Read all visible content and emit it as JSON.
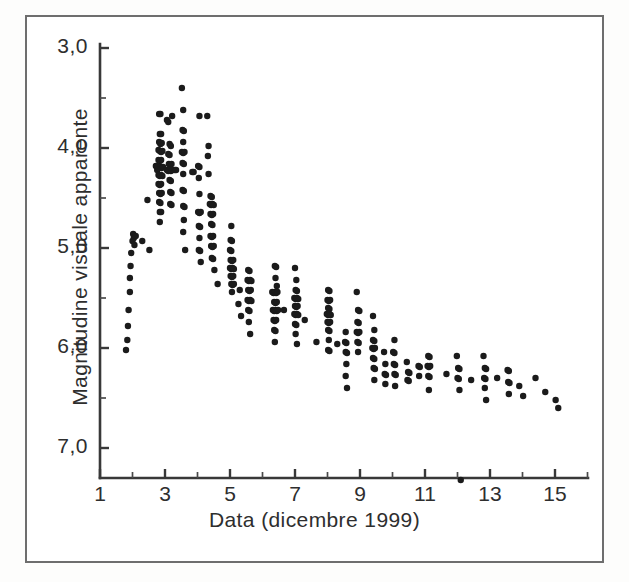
{
  "figure": {
    "background_color": "#ffffff",
    "frame_color": "#6e6e6e",
    "marker_color": "#1b1b1b"
  },
  "chart_data": {
    "type": "scatter",
    "title": "",
    "xlabel": "Data (dicembre 1999)",
    "ylabel": "Magnitudine visuale apparente",
    "xlim": [
      1,
      16
    ],
    "ylim": [
      7.6,
      3.0
    ],
    "y_inverted": true,
    "grid": false,
    "legend": null,
    "xticks_major": [
      1,
      3,
      5,
      7,
      9,
      11,
      13,
      15
    ],
    "xticks_major_labels": [
      "1",
      "3",
      "5",
      "7",
      "9",
      "11",
      "13",
      "15"
    ],
    "xticks_minor": [
      2,
      4,
      6,
      8,
      10,
      12,
      14,
      16
    ],
    "yticks_major": [
      3.0,
      4.0,
      5.0,
      6.0,
      7.0
    ],
    "yticks_major_labels": [
      "3,0",
      "4,0",
      "5,0",
      "6,0",
      "7,0"
    ],
    "yticks_minor": [
      3.5,
      4.5,
      5.5,
      6.5
    ],
    "marker": "filled-circle",
    "marker_size_px": 6.4,
    "points": [
      [
        1.8,
        6.02
      ],
      [
        1.84,
        5.92
      ],
      [
        1.86,
        5.78
      ],
      [
        1.88,
        5.62
      ],
      [
        1.92,
        5.44
      ],
      [
        1.92,
        5.3
      ],
      [
        1.94,
        5.18
      ],
      [
        1.96,
        5.05
      ],
      [
        2.0,
        4.93
      ],
      [
        2.02,
        4.86
      ],
      [
        2.04,
        4.9
      ],
      [
        2.06,
        4.97
      ],
      [
        2.1,
        4.88
      ],
      [
        2.3,
        4.93
      ],
      [
        2.46,
        4.52
      ],
      [
        2.52,
        5.02
      ],
      [
        2.72,
        4.18
      ],
      [
        2.76,
        4.22
      ],
      [
        2.82,
        3.66
      ],
      [
        2.86,
        3.66
      ],
      [
        2.84,
        3.86
      ],
      [
        2.88,
        3.86
      ],
      [
        2.82,
        3.94
      ],
      [
        2.86,
        3.96
      ],
      [
        2.9,
        3.95
      ],
      [
        2.8,
        4.02
      ],
      [
        2.84,
        4.03
      ],
      [
        2.88,
        4.04
      ],
      [
        2.92,
        4.03
      ],
      [
        2.8,
        4.12
      ],
      [
        2.84,
        4.13
      ],
      [
        2.88,
        4.12
      ],
      [
        2.74,
        4.18
      ],
      [
        2.78,
        4.19
      ],
      [
        2.82,
        4.2
      ],
      [
        2.86,
        4.19
      ],
      [
        2.9,
        4.2
      ],
      [
        2.94,
        4.19
      ],
      [
        2.8,
        4.27
      ],
      [
        2.84,
        4.28
      ],
      [
        2.88,
        4.27
      ],
      [
        2.92,
        4.28
      ],
      [
        2.8,
        4.36
      ],
      [
        2.84,
        4.37
      ],
      [
        2.88,
        4.36
      ],
      [
        2.82,
        4.45
      ],
      [
        2.86,
        4.46
      ],
      [
        2.9,
        4.45
      ],
      [
        2.82,
        4.54
      ],
      [
        2.86,
        4.55
      ],
      [
        2.84,
        4.64
      ],
      [
        2.88,
        4.64
      ],
      [
        2.84,
        4.74
      ],
      [
        3.06,
        3.72
      ],
      [
        3.1,
        3.74
      ],
      [
        3.22,
        3.68
      ],
      [
        3.14,
        3.96
      ],
      [
        3.18,
        3.98
      ],
      [
        3.1,
        4.06
      ],
      [
        3.14,
        4.07
      ],
      [
        3.12,
        4.16
      ],
      [
        3.16,
        4.17
      ],
      [
        3.2,
        4.16
      ],
      [
        3.06,
        4.22
      ],
      [
        3.1,
        4.23
      ],
      [
        3.14,
        4.22
      ],
      [
        3.18,
        4.23
      ],
      [
        3.22,
        4.22
      ],
      [
        3.14,
        4.32
      ],
      [
        3.18,
        4.33
      ],
      [
        3.16,
        4.44
      ],
      [
        3.2,
        4.45
      ],
      [
        3.16,
        4.56
      ],
      [
        3.2,
        4.57
      ],
      [
        3.3,
        4.22
      ],
      [
        3.34,
        4.22
      ],
      [
        3.52,
        3.4
      ],
      [
        3.56,
        3.62
      ],
      [
        3.54,
        3.82
      ],
      [
        3.58,
        3.83
      ],
      [
        3.56,
        3.94
      ],
      [
        3.52,
        4.04
      ],
      [
        3.56,
        4.05
      ],
      [
        3.6,
        4.04
      ],
      [
        3.54,
        4.15
      ],
      [
        3.58,
        4.16
      ],
      [
        3.56,
        4.26
      ],
      [
        3.54,
        4.42
      ],
      [
        3.58,
        4.43
      ],
      [
        3.56,
        4.58
      ],
      [
        3.6,
        4.59
      ],
      [
        3.58,
        4.72
      ],
      [
        3.56,
        4.84
      ],
      [
        3.62,
        5.02
      ],
      [
        3.84,
        4.24
      ],
      [
        3.88,
        4.24
      ],
      [
        4.06,
        3.68
      ],
      [
        4.02,
        4.18
      ],
      [
        4.06,
        4.19
      ],
      [
        4.04,
        4.3
      ],
      [
        4.06,
        4.46
      ],
      [
        4.02,
        4.64
      ],
      [
        4.06,
        4.65
      ],
      [
        4.1,
        4.64
      ],
      [
        4.04,
        4.78
      ],
      [
        4.08,
        4.79
      ],
      [
        4.06,
        4.9
      ],
      [
        4.04,
        5.02
      ],
      [
        4.08,
        5.03
      ],
      [
        4.1,
        5.14
      ],
      [
        4.3,
        3.68
      ],
      [
        4.34,
        3.98
      ],
      [
        4.32,
        4.08
      ],
      [
        4.34,
        4.26
      ],
      [
        4.4,
        4.48
      ],
      [
        4.44,
        4.49
      ],
      [
        4.38,
        4.56
      ],
      [
        4.42,
        4.57
      ],
      [
        4.46,
        4.56
      ],
      [
        4.5,
        4.57
      ],
      [
        4.4,
        4.66
      ],
      [
        4.44,
        4.67
      ],
      [
        4.48,
        4.66
      ],
      [
        4.42,
        4.76
      ],
      [
        4.46,
        4.77
      ],
      [
        4.4,
        4.88
      ],
      [
        4.44,
        4.89
      ],
      [
        4.48,
        4.88
      ],
      [
        4.42,
        4.98
      ],
      [
        4.46,
        4.99
      ],
      [
        4.5,
        4.98
      ],
      [
        4.44,
        5.1
      ],
      [
        4.48,
        5.11
      ],
      [
        4.52,
        5.22
      ],
      [
        4.62,
        5.36
      ],
      [
        5.04,
        4.78
      ],
      [
        5.02,
        4.92
      ],
      [
        5.06,
        4.93
      ],
      [
        5.0,
        5.02
      ],
      [
        5.04,
        5.03
      ],
      [
        5.02,
        5.12
      ],
      [
        5.06,
        5.13
      ],
      [
        5.1,
        5.12
      ],
      [
        5.0,
        5.2
      ],
      [
        5.04,
        5.21
      ],
      [
        5.08,
        5.2
      ],
      [
        5.12,
        5.21
      ],
      [
        5.02,
        5.28
      ],
      [
        5.06,
        5.29
      ],
      [
        5.1,
        5.28
      ],
      [
        5.04,
        5.36
      ],
      [
        5.08,
        5.37
      ],
      [
        5.12,
        5.36
      ],
      [
        5.06,
        5.44
      ],
      [
        5.3,
        5.42
      ],
      [
        5.26,
        5.56
      ],
      [
        5.34,
        5.68
      ],
      [
        5.56,
        5.22
      ],
      [
        5.6,
        5.23
      ],
      [
        5.54,
        5.32
      ],
      [
        5.58,
        5.33
      ],
      [
        5.62,
        5.32
      ],
      [
        5.66,
        5.33
      ],
      [
        5.56,
        5.42
      ],
      [
        5.6,
        5.43
      ],
      [
        5.64,
        5.42
      ],
      [
        5.54,
        5.52
      ],
      [
        5.58,
        5.53
      ],
      [
        5.62,
        5.52
      ],
      [
        5.66,
        5.53
      ],
      [
        5.56,
        5.62
      ],
      [
        5.6,
        5.63
      ],
      [
        5.58,
        5.74
      ],
      [
        5.62,
        5.86
      ],
      [
        6.38,
        5.18
      ],
      [
        6.42,
        5.19
      ],
      [
        6.4,
        5.3
      ],
      [
        6.44,
        5.38
      ],
      [
        6.3,
        5.44
      ],
      [
        6.34,
        5.45
      ],
      [
        6.38,
        5.44
      ],
      [
        6.42,
        5.45
      ],
      [
        6.46,
        5.44
      ],
      [
        6.36,
        5.54
      ],
      [
        6.4,
        5.55
      ],
      [
        6.44,
        5.54
      ],
      [
        6.32,
        5.62
      ],
      [
        6.36,
        5.63
      ],
      [
        6.4,
        5.62
      ],
      [
        6.44,
        5.63
      ],
      [
        6.48,
        5.62
      ],
      [
        6.34,
        5.72
      ],
      [
        6.38,
        5.73
      ],
      [
        6.42,
        5.72
      ],
      [
        6.36,
        5.82
      ],
      [
        6.4,
        5.83
      ],
      [
        6.38,
        5.94
      ],
      [
        6.66,
        5.62
      ],
      [
        7.0,
        5.2
      ],
      [
        7.04,
        5.32
      ],
      [
        7.02,
        5.42
      ],
      [
        7.06,
        5.43
      ],
      [
        6.98,
        5.5
      ],
      [
        7.02,
        5.51
      ],
      [
        7.06,
        5.5
      ],
      [
        7.1,
        5.51
      ],
      [
        7.0,
        5.58
      ],
      [
        7.04,
        5.59
      ],
      [
        7.08,
        5.58
      ],
      [
        6.98,
        5.66
      ],
      [
        7.02,
        5.67
      ],
      [
        7.06,
        5.66
      ],
      [
        7.1,
        5.67
      ],
      [
        7.0,
        5.76
      ],
      [
        7.04,
        5.77
      ],
      [
        7.02,
        5.86
      ],
      [
        7.06,
        5.96
      ],
      [
        7.3,
        5.72
      ],
      [
        7.66,
        5.94
      ],
      [
        8.02,
        5.42
      ],
      [
        8.06,
        5.43
      ],
      [
        8.0,
        5.52
      ],
      [
        8.04,
        5.53
      ],
      [
        8.08,
        5.52
      ],
      [
        8.02,
        5.6
      ],
      [
        8.06,
        5.61
      ],
      [
        7.98,
        5.66
      ],
      [
        8.02,
        5.67
      ],
      [
        8.06,
        5.66
      ],
      [
        8.1,
        5.67
      ],
      [
        8.0,
        5.74
      ],
      [
        8.04,
        5.75
      ],
      [
        8.08,
        5.74
      ],
      [
        8.02,
        5.82
      ],
      [
        8.06,
        5.83
      ],
      [
        8.04,
        5.92
      ],
      [
        8.02,
        6.02
      ],
      [
        8.06,
        6.03
      ],
      [
        8.3,
        5.96
      ],
      [
        8.56,
        5.84
      ],
      [
        8.54,
        5.94
      ],
      [
        8.58,
        5.95
      ],
      [
        8.56,
        6.04
      ],
      [
        8.6,
        6.05
      ],
      [
        8.58,
        6.16
      ],
      [
        8.56,
        6.28
      ],
      [
        8.6,
        6.4
      ],
      [
        8.9,
        5.44
      ],
      [
        8.94,
        5.62
      ],
      [
        8.98,
        5.63
      ],
      [
        8.92,
        5.74
      ],
      [
        8.96,
        5.75
      ],
      [
        8.9,
        5.84
      ],
      [
        8.94,
        5.85
      ],
      [
        8.98,
        5.84
      ],
      [
        8.92,
        5.94
      ],
      [
        8.96,
        5.95
      ],
      [
        8.94,
        6.04
      ],
      [
        9.4,
        5.68
      ],
      [
        9.44,
        5.82
      ],
      [
        9.4,
        5.92
      ],
      [
        9.44,
        5.93
      ],
      [
        9.38,
        6.0
      ],
      [
        9.42,
        6.01
      ],
      [
        9.46,
        6.0
      ],
      [
        9.4,
        6.1
      ],
      [
        9.44,
        6.11
      ],
      [
        9.42,
        6.2
      ],
      [
        9.46,
        6.21
      ],
      [
        9.44,
        6.32
      ],
      [
        9.74,
        6.04
      ],
      [
        9.78,
        6.16
      ],
      [
        9.76,
        6.26
      ],
      [
        9.8,
        6.27
      ],
      [
        9.78,
        6.36
      ],
      [
        10.06,
        5.92
      ],
      [
        10.02,
        6.04
      ],
      [
        10.06,
        6.05
      ],
      [
        10.04,
        6.16
      ],
      [
        10.08,
        6.17
      ],
      [
        10.06,
        6.26
      ],
      [
        10.1,
        6.27
      ],
      [
        10.08,
        6.38
      ],
      [
        10.44,
        6.14
      ],
      [
        10.48,
        6.24
      ],
      [
        10.52,
        6.25
      ],
      [
        10.46,
        6.32
      ],
      [
        10.5,
        6.33
      ],
      [
        10.8,
        6.18
      ],
      [
        10.84,
        6.19
      ],
      [
        10.82,
        6.28
      ],
      [
        11.1,
        6.08
      ],
      [
        11.14,
        6.09
      ],
      [
        11.08,
        6.18
      ],
      [
        11.12,
        6.19
      ],
      [
        11.16,
        6.18
      ],
      [
        11.1,
        6.28
      ],
      [
        11.14,
        6.29
      ],
      [
        11.12,
        6.42
      ],
      [
        11.66,
        6.26
      ],
      [
        11.98,
        6.08
      ],
      [
        12.02,
        6.2
      ],
      [
        12.06,
        6.21
      ],
      [
        12.0,
        6.3
      ],
      [
        12.04,
        6.31
      ],
      [
        12.06,
        6.42
      ],
      [
        12.1,
        7.32
      ],
      [
        12.42,
        6.32
      ],
      [
        12.8,
        6.08
      ],
      [
        12.84,
        6.2
      ],
      [
        12.88,
        6.21
      ],
      [
        12.82,
        6.3
      ],
      [
        12.86,
        6.31
      ],
      [
        12.84,
        6.4
      ],
      [
        12.88,
        6.52
      ],
      [
        13.22,
        6.3
      ],
      [
        13.54,
        6.22
      ],
      [
        13.58,
        6.23
      ],
      [
        13.56,
        6.34
      ],
      [
        13.6,
        6.35
      ],
      [
        13.58,
        6.46
      ],
      [
        13.9,
        6.38
      ],
      [
        14.02,
        6.48
      ],
      [
        14.4,
        6.3
      ],
      [
        14.7,
        6.44
      ],
      [
        15.02,
        6.52
      ],
      [
        15.1,
        6.6
      ]
    ]
  }
}
